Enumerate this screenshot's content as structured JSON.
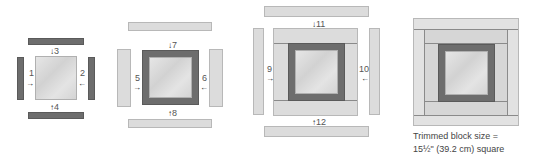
{
  "diagram": {
    "colors": {
      "dark_strip": "#6d6d6d",
      "light_strip": "#dcdcdc",
      "center": "#dadada"
    },
    "steps": [
      {
        "panel": 1,
        "labels": {
          "left": "1",
          "right": "2",
          "top": "3",
          "bottom": "4"
        }
      },
      {
        "panel": 2,
        "labels": {
          "left": "5",
          "right": "6",
          "top": "7",
          "bottom": "8"
        }
      },
      {
        "panel": 3,
        "labels": {
          "left": "9",
          "right": "10",
          "top": "11",
          "bottom": "12"
        }
      }
    ],
    "arrows": {
      "right": "→",
      "left": "←",
      "down": "↓",
      "up": "↑"
    },
    "final": {
      "caption_line1": "Trimmed block size =",
      "caption_line2": "15½\" (39.2 cm) square"
    }
  }
}
